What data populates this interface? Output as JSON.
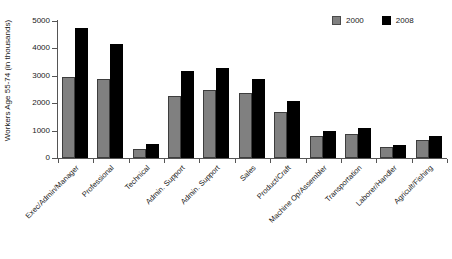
{
  "chart_data": {
    "type": "bar",
    "title": "",
    "xlabel": "",
    "ylabel": "Workers Age 55-74 (in thousands)",
    "ylim": [
      0,
      5000
    ],
    "yticks": [
      0,
      1000,
      2000,
      3000,
      4000,
      5000
    ],
    "ytick_labels": [
      "0",
      "1000",
      "2000",
      "3000",
      "4000",
      "5000"
    ],
    "grid": false,
    "legend_position": "top-right",
    "categories": [
      "Exec/Admin/Manager",
      "Professional",
      "Technical",
      "Admin. Support",
      "Admin. Support",
      "Sales",
      "Product/Craft",
      "Machine Op/Assembler",
      "Transportation",
      "Laborer/Handler",
      "Agricult/Fishing"
    ],
    "series": [
      {
        "name": "2000",
        "color": "#808080",
        "values": [
          2950,
          2890,
          330,
          2280,
          2500,
          2390,
          1680,
          820,
          860,
          400,
          650
        ]
      },
      {
        "name": "2008",
        "color": "#000000",
        "values": [
          4760,
          4170,
          500,
          3190,
          3280,
          2870,
          2090,
          980,
          1080,
          490,
          800
        ]
      }
    ]
  },
  "legend": {
    "entries": [
      {
        "label": "2000",
        "color": "#808080"
      },
      {
        "label": "2008",
        "color": "#000000"
      }
    ]
  }
}
